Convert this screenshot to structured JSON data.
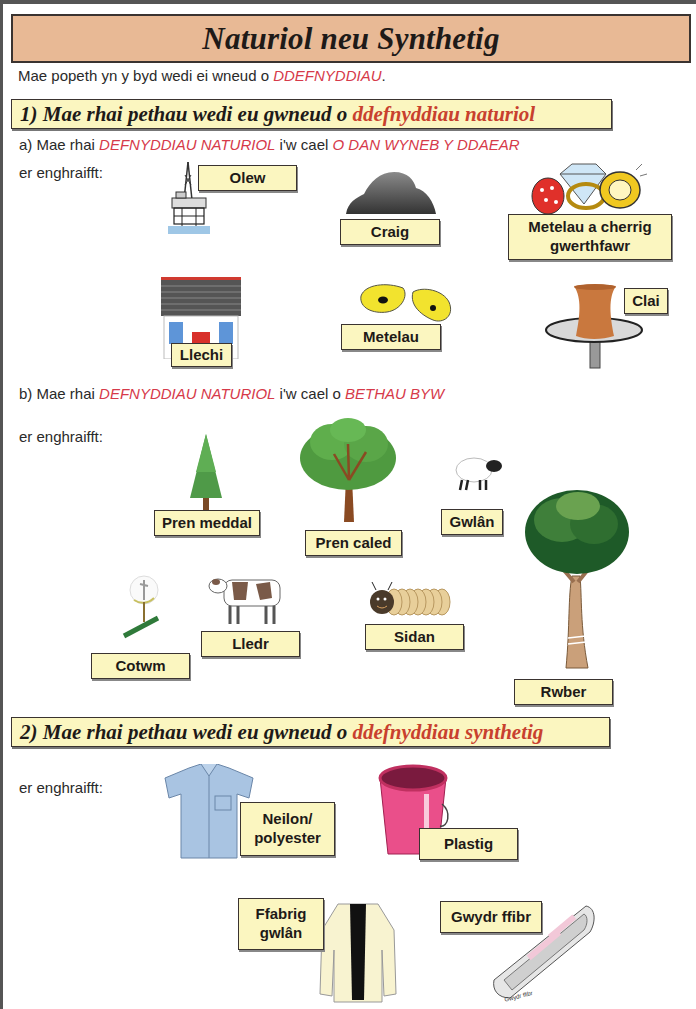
{
  "title": "Naturiol neu Synthetig",
  "intro": {
    "text": "Mae popeth yn y byd wedi ei wneud o ",
    "highlight": "DDEFNYDDIAU",
    "end": "."
  },
  "section1": {
    "heading_prefix": "1)  Mae rhai pethau wedi eu gwneud o ",
    "heading_highlight": "ddefnyddiau naturiol",
    "part_a": {
      "prefix": "a)  Mae rhai ",
      "highlight1": "DEFNYDDIAU NATURIOL",
      "middle": " i'w cael ",
      "highlight2": "O DAN WYNEB Y DDAEAR",
      "example_label": "er enghraifft:",
      "items": [
        {
          "label": "Olew",
          "icon": "oil-rig-icon"
        },
        {
          "label": "Craig",
          "icon": "rock-icon"
        },
        {
          "label": "Metelau a cherrig gwerthfawr",
          "line1": "Metelau a cherrig",
          "line2": "gwerthfawr",
          "icon": "jewels-icon"
        },
        {
          "label": "Llechi",
          "icon": "slate-roof-house-icon"
        },
        {
          "label": "Metelau",
          "icon": "metal-ore-icon"
        },
        {
          "label": "Clai",
          "icon": "clay-pot-wheel-icon"
        }
      ]
    },
    "part_b": {
      "prefix": "b)  Mae rhai ",
      "highlight1": "DEFNYDDIAU NATURIOL",
      "middle": " i'w cael o ",
      "highlight2": "BETHAU BYW",
      "example_label": "er enghraifft:",
      "items": [
        {
          "label": "Pren meddal",
          "icon": "conifer-tree-icon"
        },
        {
          "label": "Pren caled",
          "icon": "deciduous-tree-icon"
        },
        {
          "label": "Gwlân",
          "icon": "sheep-icon"
        },
        {
          "label": "Cotwm",
          "icon": "cotton-plant-icon"
        },
        {
          "label": "Lledr",
          "icon": "cow-icon"
        },
        {
          "label": "Sidan",
          "icon": "silkworm-icon"
        },
        {
          "label": "Rwber",
          "icon": "rubber-tree-icon"
        }
      ]
    }
  },
  "section2": {
    "heading_prefix": "2)  Mae rhai pethau wedi eu gwneud o ",
    "heading_highlight": "ddefnyddiau synthetig",
    "example_label": "er enghraifft:",
    "items": [
      {
        "line1": "Neilon/",
        "line2": "polyester",
        "icon": "shirt-icon"
      },
      {
        "label": "Plastig",
        "icon": "bucket-icon"
      },
      {
        "line1": "Ffabrig",
        "line2": "gwlân",
        "icon": "coat-icon"
      },
      {
        "label": "Gwydr ffibr",
        "icon": "boat-icon",
        "boat_text": "Gwydr ffibr"
      }
    ]
  },
  "colors": {
    "title_bg": "#e8b995",
    "label_bg": "#fbf6c0",
    "highlight_red": "#d63a4a",
    "heading_red": "#c8402e"
  }
}
